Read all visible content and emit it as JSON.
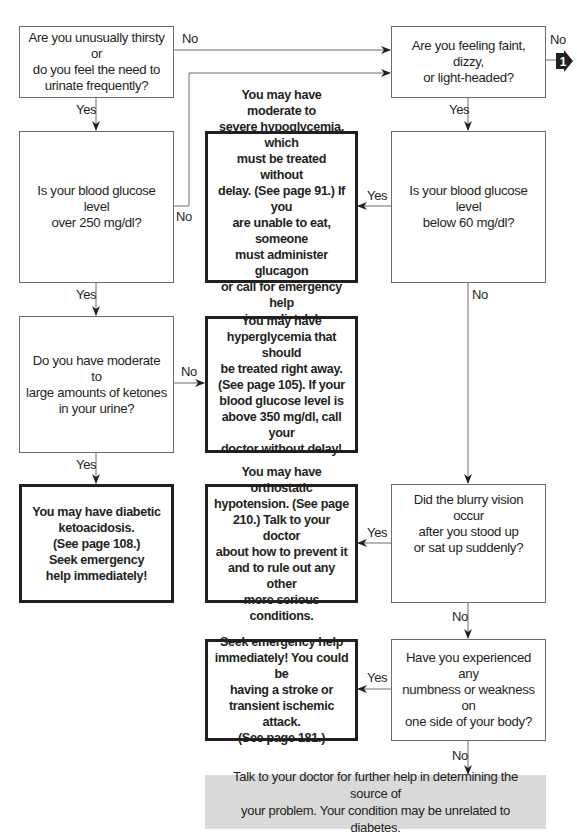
{
  "flowchart": {
    "nodes": {
      "thirsty": {
        "text": "Are you unusually thirsty or\ndo you feel the need to\nurinate frequently?"
      },
      "faint": {
        "text": "Are you feeling faint, dizzy,\nor light-headed?"
      },
      "glucose_over_250": {
        "text": "Is your blood glucose level\nover 250 mg/dl?"
      },
      "hypoglycemia": {
        "text": "You may have moderate to\nsevere hypoglycemia, which\nmust be treated without\ndelay. (See page 91.) If you\nare unable to eat, someone\nmust administer glucagon\nor call for emergency help\nimmediately!"
      },
      "glucose_below_60": {
        "text": "Is your blood glucose level\nbelow 60 mg/dl?"
      },
      "ketones": {
        "text": "Do you have moderate to\nlarge amounts of ketones\nin your urine?"
      },
      "hyperglycemia": {
        "text": "You may have\nhyperglycemia that should\nbe treated right away.\n(See page 105). If your\nblood glucose level is\nabove 350 mg/dl, call your\ndoctor without delay!"
      },
      "ketoacidosis": {
        "text": "You may have diabetic\nketoacidosis.\n(See page 108.)\nSeek emergency\nhelp immediately!"
      },
      "orthostatic": {
        "text": "You may have orthostatic\nhypotension. (See page\n210.) Talk to your doctor\nabout how to prevent it\nand to rule out any other\nmore serious conditions."
      },
      "blurry": {
        "text": "Did the blurry vision occur\nafter you stood up\nor sat up suddenly?"
      },
      "stroke": {
        "text": "Seek emergency help\nimmediately! You could be\nhaving a stroke or\ntransient ischemic attack.\n(See page 181.)"
      },
      "numbness": {
        "text": "Have you experienced any\nnumbness or weakness on\none side of your body?"
      },
      "talk_doctor": {
        "text": "Talk to your doctor for further help in determining the source of\nyour problem. Your condition may be unrelated to diabetes."
      }
    },
    "edge_labels": {
      "thirsty_no": "No",
      "thirsty_yes": "Yes",
      "faint_no": "No",
      "faint_yes": "Yes",
      "glucose250_no": "No",
      "glucose250_yes": "Yes",
      "below60_yes": "Yes",
      "below60_no": "No",
      "ketones_no": "No",
      "ketones_yes": "Yes",
      "blurry_yes": "Yes",
      "blurry_no": "No",
      "numbness_yes": "Yes",
      "numbness_no": "No"
    },
    "continuation_marker": {
      "label": "1",
      "icon": "arrow-right-badge-icon"
    },
    "colors": {
      "line": "#6d6d6d",
      "text": "#231f20",
      "result_fill": "#d9d9d9"
    }
  }
}
